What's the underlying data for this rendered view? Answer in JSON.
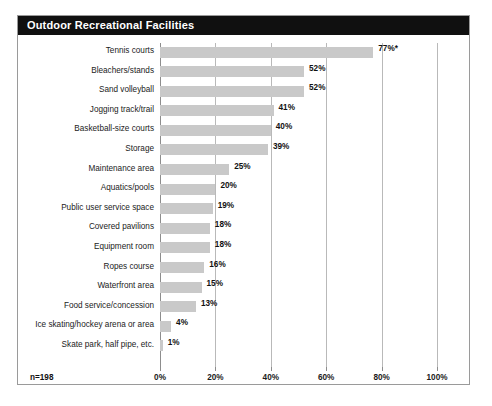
{
  "card": {
    "title": "Outdoor Recreational Facilities",
    "sample_note": "n=198"
  },
  "chart_data": {
    "type": "bar",
    "orientation": "horizontal",
    "title": "Outdoor Recreational Facilities",
    "xlabel": "",
    "ylabel": "",
    "xlim": [
      0,
      100
    ],
    "grid": true,
    "legend": "none",
    "sample_note": "n=198",
    "xticks": [
      "0%",
      "20%",
      "40%",
      "60%",
      "80%",
      "100%"
    ],
    "xtick_values": [
      0,
      20,
      40,
      60,
      80,
      100
    ],
    "categories": [
      "Tennis courts",
      "Bleachers/stands",
      "Sand volleyball",
      "Jogging track/trail",
      "Basketball-size courts",
      "Storage",
      "Maintenance area",
      "Aquatics/pools",
      "Public user service space",
      "Covered pavilions",
      "Equipment room",
      "Ropes course",
      "Waterfront area",
      "Food service/concession",
      "Ice skating/hockey arena or area",
      "Skate park, half pipe, etc."
    ],
    "values": [
      77,
      52,
      52,
      41,
      40,
      39,
      25,
      20,
      19,
      18,
      18,
      16,
      15,
      13,
      4,
      1
    ],
    "value_labels": [
      "77%*",
      "52%",
      "52%",
      "41%",
      "40%",
      "39%",
      "25%",
      "20%",
      "19%",
      "18%",
      "18%",
      "16%",
      "15%",
      "13%",
      "4%",
      "1%"
    ],
    "colors": {
      "bar": "#c9c9c9",
      "title_bar": "#101010",
      "title_text": "#ffffff",
      "gridline": "#b9b9b9",
      "axis": "#8d8d8d",
      "border": "#9a9a9a",
      "text": "#1b1b1b"
    }
  }
}
